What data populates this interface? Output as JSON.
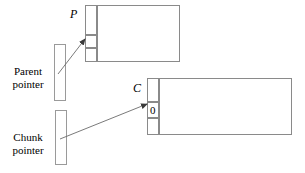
{
  "figure": {
    "title": "",
    "labels": {
      "parent_node_label": "P",
      "chunk_node_label": "C",
      "chunk_cell_value": "0",
      "parent_pointer_line1": "Parent",
      "parent_pointer_line2": "pointer",
      "chunk_pointer_line1": "Chunk",
      "chunk_pointer_line2": "pointer"
    },
    "colors": {
      "stroke": "#8a8a8a",
      "arrow": "#555555",
      "text": "#000000",
      "background": "#ffffff"
    },
    "structures": [
      {
        "name": "parent-structure",
        "label": "P",
        "cells": [
          "",
          "",
          ""
        ],
        "payload": ""
      },
      {
        "name": "chunk-structure",
        "label": "C",
        "cells": [
          "",
          "0",
          ""
        ],
        "payload": ""
      }
    ],
    "pointers": [
      {
        "name": "parent-pointer",
        "line1": "Parent",
        "line2": "pointer",
        "target": "P"
      },
      {
        "name": "chunk-pointer",
        "line1": "Chunk",
        "line2": "pointer",
        "target": "C"
      }
    ]
  }
}
